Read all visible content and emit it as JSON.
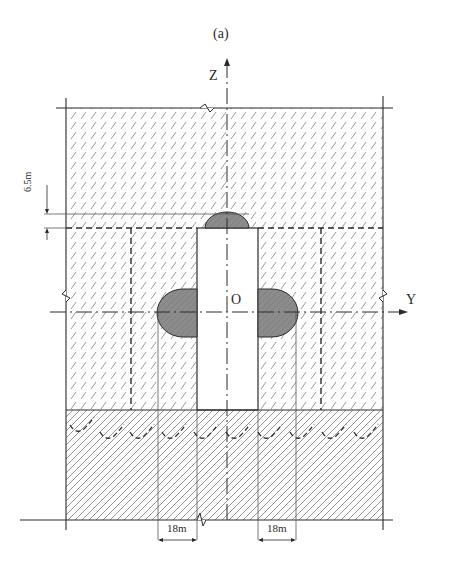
{
  "figure": {
    "caption": "(a)",
    "axes": {
      "z_label": "Z",
      "y_label": "Y",
      "origin_label": "O"
    },
    "dimensions": {
      "vertical_offset": "6.5m",
      "left_width": "18m",
      "right_width": "18m"
    },
    "regions": [
      {
        "name": "upper-soil-layer",
        "pattern": "dashed-hatch"
      },
      {
        "name": "lower-soil-layer",
        "pattern": "solid-hatch"
      },
      {
        "name": "central-pit",
        "fill": "white"
      },
      {
        "name": "left-grout-zone",
        "fill": "#8a8a8a"
      },
      {
        "name": "right-grout-zone",
        "fill": "#8a8a8a"
      },
      {
        "name": "top-grout-zone",
        "fill": "#8a8a8a"
      }
    ],
    "colors": {
      "line": "#2a2a2a",
      "grout": "#8c8c8c",
      "hatch": "#9a9a9a"
    }
  }
}
